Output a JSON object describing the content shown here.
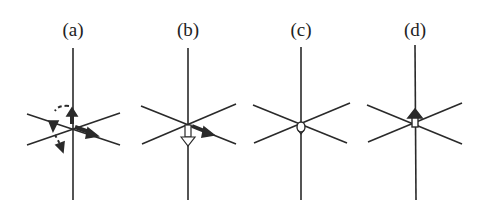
{
  "figure": {
    "panels": [
      {
        "id": "a",
        "label": "(a)",
        "center_x": 73,
        "arrows": [
          "up",
          "right-down-diagonal",
          "dashed-rotation"
        ]
      },
      {
        "id": "b",
        "label": "(b)",
        "center_x": 188,
        "arrows": [
          "down",
          "right-down-diagonal"
        ]
      },
      {
        "id": "c",
        "label": "(c)",
        "center_x": 301,
        "arrows": [
          "small-center"
        ]
      },
      {
        "id": "d",
        "label": "(d)",
        "center_x": 415,
        "arrows": [
          "up"
        ]
      }
    ],
    "line_color": "#2a2a2a"
  }
}
